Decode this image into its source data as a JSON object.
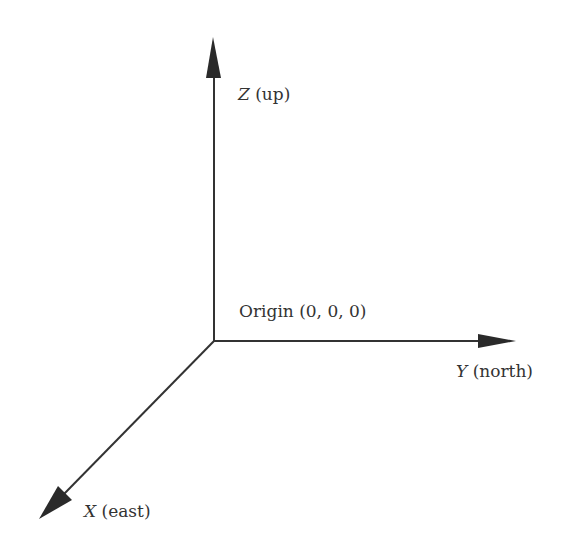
{
  "diagram": {
    "type": "3d-coordinate-axes",
    "origin": {
      "label": "Origin (0, 0, 0)",
      "x": 214,
      "y": 341
    },
    "axes": [
      {
        "id": "z",
        "variable": "Z",
        "direction": "(up)",
        "tip": [
          213,
          37
        ]
      },
      {
        "id": "y",
        "variable": "Y",
        "direction": "(north)",
        "tip": [
          515,
          341
        ]
      },
      {
        "id": "x",
        "variable": "X",
        "direction": "(east)",
        "tip": [
          40,
          518
        ]
      }
    ],
    "colors": {
      "line": "#333333",
      "background": "#ffffff"
    }
  }
}
